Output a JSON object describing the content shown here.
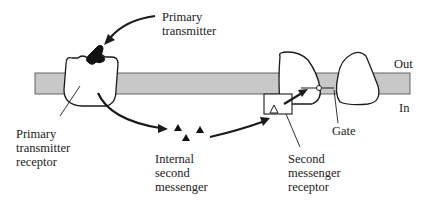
{
  "diagram": {
    "labels": {
      "primary_transmitter": "Primary\ntransmitter",
      "primary_transmitter_receptor": "Primary\ntransmitter\nreceptor",
      "internal_second_messenger": "Internal\nsecond\nmessenger",
      "second_messenger_receptor": "Second\nmessenger\nreceptor",
      "gate": "Gate",
      "out": "Out",
      "in": "In"
    },
    "colors": {
      "membrane": "#c8c8c8",
      "stroke": "#1a1a1a",
      "background": "#ffffff"
    }
  }
}
